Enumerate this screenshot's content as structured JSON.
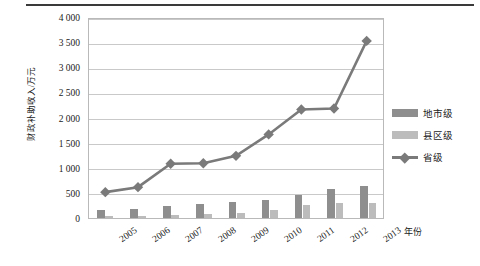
{
  "figure": {
    "has_top_rule": true,
    "background": "#ffffff"
  },
  "chart_data": {
    "type": "bar",
    "title": "",
    "xlabel": "年份",
    "ylabel": "财政补助收入/万元",
    "categories": [
      "2005",
      "2006",
      "2007",
      "2008",
      "2009",
      "2010",
      "2011",
      "2012",
      "2013"
    ],
    "ylim": [
      0,
      4000
    ],
    "yticks": [
      0,
      500,
      1000,
      1500,
      2000,
      2500,
      3000,
      3500,
      4000
    ],
    "ytick_labels": [
      "0",
      "500",
      "1 000",
      "1 500",
      "2 000",
      "2 500",
      "3 000",
      "3 500",
      "4 000"
    ],
    "grid": true,
    "legend_position": "right",
    "series": [
      {
        "name": "地市级",
        "kind": "bar",
        "color": "#8e8e8e",
        "values": [
          150,
          180,
          230,
          270,
          320,
          360,
          450,
          580,
          630
        ]
      },
      {
        "name": "县区级",
        "kind": "bar",
        "color": "#bcbcbc",
        "values": [
          40,
          45,
          55,
          70,
          105,
          150,
          250,
          290,
          300
        ]
      },
      {
        "name": "省级",
        "kind": "line",
        "color": "#7a7a7a",
        "marker": "diamond",
        "values": [
          520,
          620,
          1090,
          1100,
          1250,
          1680,
          2180,
          2200,
          3560
        ]
      }
    ]
  },
  "legend": {
    "items": [
      {
        "label": "地市级",
        "swatch": "bar-dark"
      },
      {
        "label": "县区级",
        "swatch": "bar-light"
      },
      {
        "label": "省级",
        "swatch": "line-diamond"
      }
    ]
  }
}
